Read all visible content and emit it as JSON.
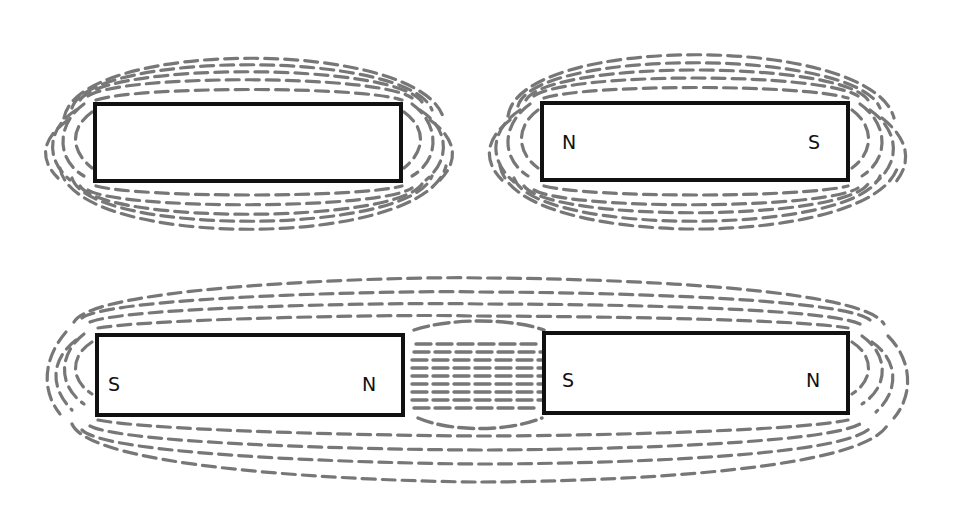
{
  "diagram": {
    "type": "bar magnet field lines",
    "colors": {
      "field_lines": "#777777",
      "magnet_outline": "#111111",
      "background": "#ffffff"
    },
    "panels": [
      {
        "id": "unlabeled-magnet",
        "description": "Single bar magnet without pole labels, surrounded by dashed field lines",
        "magnet": {
          "left_pole": "",
          "right_pole": ""
        }
      },
      {
        "id": "labeled-magnet",
        "description": "Single bar magnet with N on left and S on right, surrounded by dashed field lines",
        "magnet": {
          "left_pole": "N",
          "right_pole": "S"
        }
      },
      {
        "id": "attracting-pair",
        "description": "Two bar magnets aligned end to end (S-N  S-N) with field lines passing through the gap between them",
        "magnets": [
          {
            "left_pole": "S",
            "right_pole": "N"
          },
          {
            "left_pole": "S",
            "right_pole": "N"
          }
        ]
      }
    ]
  }
}
